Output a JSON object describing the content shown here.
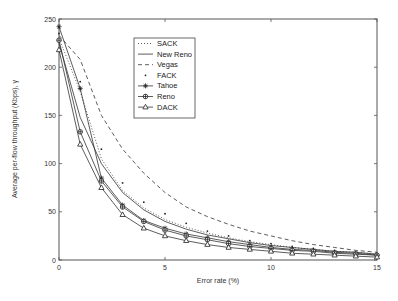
{
  "chart_data": {
    "type": "line",
    "title": "",
    "xlabel": "Error rate (%)",
    "ylabel": "Average per-flow throughput (Kbps), γ",
    "xlim": [
      0,
      15
    ],
    "ylim": [
      0,
      250
    ],
    "xticks": [
      0,
      5,
      10,
      15
    ],
    "yticks": [
      0,
      50,
      100,
      150,
      200,
      250
    ],
    "grid": false,
    "legend_position": "upper center-left",
    "x": [
      0,
      1,
      2,
      3,
      4,
      5,
      6,
      7,
      8,
      9,
      10,
      11,
      12,
      13,
      14,
      15
    ],
    "series": [
      {
        "name": "SACK",
        "style": "dotted",
        "marker": "none",
        "values": [
          230,
          175,
          105,
          72,
          54,
          42,
          34,
          28,
          23,
          19,
          16,
          13,
          11,
          9,
          8,
          6
        ]
      },
      {
        "name": "New Reno",
        "style": "solid",
        "marker": "none",
        "values": [
          225,
          148,
          100,
          70,
          52,
          40,
          32,
          26,
          22,
          18,
          15,
          13,
          11,
          9,
          8,
          6
        ]
      },
      {
        "name": "Vegas",
        "style": "dashed",
        "marker": "none",
        "values": [
          233,
          208,
          150,
          115,
          90,
          70,
          55,
          45,
          37,
          30,
          25,
          20,
          16,
          13,
          10,
          8
        ]
      },
      {
        "name": "FACK",
        "style": "points",
        "marker": "dot",
        "values": [
          235,
          185,
          115,
          80,
          60,
          48,
          38,
          30,
          25,
          20,
          17,
          14,
          12,
          10,
          8,
          6
        ]
      },
      {
        "name": "Tahoe",
        "style": "solid",
        "marker": "star",
        "values": [
          242,
          178,
          85,
          57,
          41,
          33,
          27,
          23,
          19,
          16,
          13,
          11,
          10,
          8,
          7,
          5
        ]
      },
      {
        "name": "Reno",
        "style": "solid",
        "marker": "circle-plus",
        "values": [
          228,
          133,
          82,
          55,
          40,
          31,
          25,
          21,
          17,
          14,
          12,
          10,
          9,
          7,
          6,
          5
        ]
      },
      {
        "name": "DACK",
        "style": "solid",
        "marker": "triangle",
        "values": [
          218,
          120,
          75,
          47,
          33,
          25,
          20,
          16,
          13,
          11,
          9,
          7,
          6,
          5,
          4,
          3
        ]
      }
    ]
  },
  "legend": {
    "items": [
      "SACK",
      "New Reno",
      "Vegas",
      "FACK",
      "Tahoe",
      "Reno",
      "DACK"
    ]
  },
  "axes": {
    "xlabel": "Error rate (%)",
    "ylabel": "Average per-flow throughput (Kbps), γ",
    "xtick_labels": [
      "0",
      "5",
      "10",
      "15"
    ],
    "ytick_labels": [
      "0",
      "50",
      "100",
      "150",
      "200",
      "250"
    ]
  }
}
